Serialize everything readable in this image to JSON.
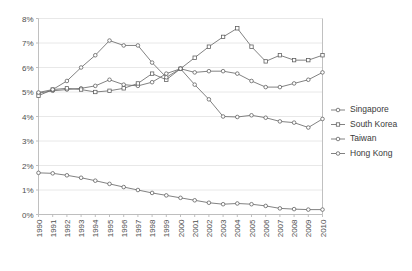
{
  "chart_data": {
    "type": "line",
    "title": "",
    "subtitle": "",
    "xlabel": "",
    "ylabel": "",
    "x": [
      1990,
      1991,
      1992,
      1993,
      1994,
      1995,
      1996,
      1997,
      1998,
      1999,
      2000,
      2001,
      2002,
      2003,
      2004,
      2005,
      2006,
      2007,
      2008,
      2009,
      2010
    ],
    "categories": [
      "1990",
      "1991",
      "1992",
      "1993",
      "1994",
      "1995",
      "1996",
      "1997",
      "1998",
      "1999",
      "2000",
      "2001",
      "2002",
      "2003",
      "2004",
      "2005",
      "2006",
      "2007",
      "2008",
      "2009",
      "2010"
    ],
    "xlim": [
      1990,
      2010
    ],
    "ylim": [
      0,
      8
    ],
    "ytick_values": [
      0,
      1,
      2,
      3,
      4,
      5,
      6,
      7,
      8
    ],
    "ytick_labels": [
      "0%",
      "1%",
      "2%",
      "3%",
      "4%",
      "5%",
      "6%",
      "7%",
      "8%"
    ],
    "grid": true,
    "grid_axis": "y",
    "legend_position": "right",
    "value_unit": "%",
    "series": [
      {
        "name": "Singapore",
        "marker": "circle",
        "color": "#6b6b6b",
        "values": [
          4.95,
          5.05,
          5.1,
          5.15,
          5.25,
          5.5,
          5.3,
          5.25,
          5.4,
          5.75,
          5.95,
          5.8,
          5.85,
          5.85,
          5.75,
          5.45,
          5.2,
          5.2,
          5.35,
          5.5,
          5.8
        ]
      },
      {
        "name": "South Korea",
        "marker": "square",
        "color": "#6b6b6b",
        "values": [
          4.85,
          5.1,
          5.15,
          5.1,
          5.0,
          5.05,
          5.15,
          5.35,
          5.75,
          5.5,
          5.95,
          6.4,
          6.85,
          7.25,
          7.6,
          6.85,
          6.25,
          6.5,
          6.3,
          6.3,
          6.5
        ]
      },
      {
        "name": "Taiwan",
        "marker": "circle",
        "color": "#6b6b6b",
        "values": [
          1.7,
          1.68,
          1.6,
          1.5,
          1.38,
          1.25,
          1.12,
          1.0,
          0.88,
          0.78,
          0.68,
          0.58,
          0.48,
          0.42,
          0.45,
          0.42,
          0.35,
          0.25,
          0.22,
          0.2,
          0.2
        ]
      },
      {
        "name": "Hong Kong",
        "marker": "circle",
        "color": "#6b6b6b",
        "values": [
          4.98,
          5.1,
          5.45,
          6.0,
          6.5,
          7.1,
          6.9,
          6.9,
          6.2,
          5.6,
          5.95,
          5.3,
          4.7,
          4.0,
          3.98,
          4.05,
          3.95,
          3.8,
          3.75,
          3.55,
          3.9
        ]
      }
    ]
  },
  "legend": {
    "entries": [
      {
        "label": "Singapore",
        "marker": "circle"
      },
      {
        "label": "South Korea",
        "marker": "square"
      },
      {
        "label": "Taiwan",
        "marker": "circle"
      },
      {
        "label": "Hong Kong",
        "marker": "circle"
      }
    ]
  }
}
